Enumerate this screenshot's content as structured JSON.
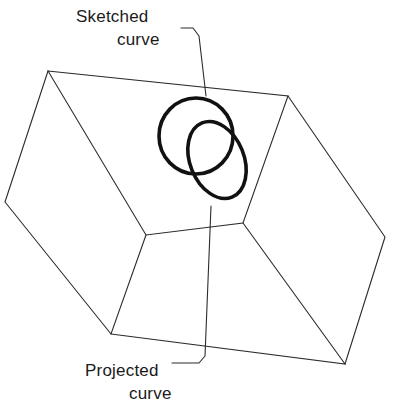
{
  "figure": {
    "background_color": "#ffffff",
    "line_color": "#2b2b2b",
    "curve_color": "#111111",
    "width": 393,
    "height": 407
  },
  "labels": {
    "sketched": {
      "line1": "Sketched",
      "line2": "curve"
    },
    "projected": {
      "line1": "Projected",
      "line2": "curve"
    }
  },
  "shapes": {
    "box": {
      "name": "parallelepiped",
      "top_face": "48,71 288,96 243,223 146,235",
      "left_face": "48,71 146,235 111,334 5,202",
      "right_face": "288,96 385,237 345,364 243,223",
      "front_lower_left": "146,235 243,223 345,364 111,334",
      "vertices": {
        "top_left": "48,71",
        "top_back": "288,96",
        "top_right_front": "243,223",
        "top_front": "146,235",
        "left": "5,202",
        "bottom_left": "111,334",
        "right": "385,237",
        "bottom_right": "345,364"
      }
    },
    "sketched_curve": {
      "type": "circle",
      "cx": 196,
      "cy": 136,
      "rx": 37,
      "ry": 38,
      "rotation": 0,
      "stroke_width": 3.6
    },
    "projected_curve": {
      "type": "ellipse",
      "cx": 217,
      "cy": 160,
      "rx": 27,
      "ry": 40,
      "rotation": -22,
      "stroke_width": 3.6
    }
  },
  "leaders": {
    "sketched": "M 181,28 L 193,28 L 199,36 L 206,96",
    "projected": "M 172,363 L 199,363 L 205,356 L 211,206"
  }
}
